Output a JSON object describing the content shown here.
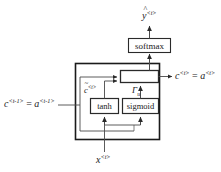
{
  "diagram": {
    "type": "neural-network-unit-diagram",
    "colors": {
      "outline_main": "#1a1a1a",
      "outline_inner": "#3a3a3a",
      "wire": "#4a4a4a",
      "background": "#ffffff",
      "text": "#1a1a1a"
    },
    "blocks": [
      {
        "id": "softmax",
        "label": "softmax"
      },
      {
        "id": "combine",
        "label": ""
      },
      {
        "id": "tanh",
        "label": "tanh"
      },
      {
        "id": "sigmoid",
        "label": "sigmoid"
      }
    ],
    "labels": {
      "output_prediction": {
        "base": "y",
        "sup": "<t>",
        "hat": true
      },
      "state_in": {
        "left_base": "c",
        "left_sup": "<t-1>",
        "eq": "=",
        "right_base": "a",
        "right_sup": "<t-1>"
      },
      "state_out": {
        "left_base": "c",
        "left_sup": "<t>",
        "eq": "=",
        "right_base": "a",
        "right_sup": "<t>"
      },
      "candidate": {
        "base": "c",
        "sup": "<t>",
        "tilde": true
      },
      "update_gate": {
        "base": "Γ",
        "sub": "u"
      },
      "input": {
        "base": "x",
        "sup": "<t>"
      }
    }
  }
}
